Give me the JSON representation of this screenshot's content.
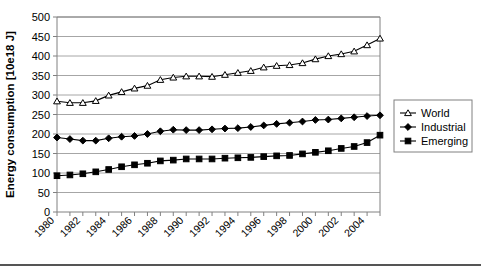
{
  "chart_data": {
    "type": "line",
    "title": "",
    "xlabel": "",
    "ylabel": "Energy consumption [10e18 J]",
    "ylim": [
      0,
      500
    ],
    "ytick_step": 50,
    "yticks": [
      "0",
      "50",
      "100",
      "150",
      "200",
      "250",
      "300",
      "350",
      "400",
      "450",
      "500"
    ],
    "xlim": [
      1980,
      2005
    ],
    "xticks_major": [
      "1980",
      "1982",
      "1984",
      "1986",
      "1988",
      "1990",
      "1992",
      "1994",
      "1996",
      "1998",
      "2000",
      "2002",
      "2004"
    ],
    "x": [
      1980,
      1981,
      1982,
      1983,
      1984,
      1985,
      1986,
      1987,
      1988,
      1989,
      1990,
      1991,
      1992,
      1993,
      1994,
      1995,
      1996,
      1997,
      1998,
      1999,
      2000,
      2001,
      2002,
      2003,
      2004,
      2005
    ],
    "grid": true,
    "grid_axis": "y",
    "legend_position": "right",
    "series": [
      {
        "name": "World",
        "marker": "open-triangle",
        "values": [
          284,
          280,
          280,
          285,
          299,
          308,
          317,
          324,
          339,
          345,
          348,
          348,
          347,
          352,
          357,
          362,
          371,
          375,
          377,
          382,
          392,
          400,
          405,
          412,
          428,
          445
        ]
      },
      {
        "name": "Industrial",
        "marker": "filled-diamond",
        "values": [
          191,
          187,
          183,
          183,
          189,
          193,
          195,
          200,
          207,
          211,
          210,
          210,
          212,
          214,
          215,
          218,
          222,
          226,
          229,
          232,
          236,
          237,
          240,
          243,
          246,
          248
        ]
      },
      {
        "name": "Emerging",
        "marker": "filled-square",
        "values": [
          93,
          95,
          98,
          103,
          109,
          116,
          121,
          125,
          131,
          133,
          136,
          136,
          136,
          138,
          139,
          140,
          142,
          144,
          145,
          149,
          153,
          157,
          163,
          168,
          178,
          197
        ]
      }
    ]
  },
  "legend": {
    "items": [
      {
        "label": "World"
      },
      {
        "label": "Industrial"
      },
      {
        "label": "Emerging"
      }
    ]
  }
}
